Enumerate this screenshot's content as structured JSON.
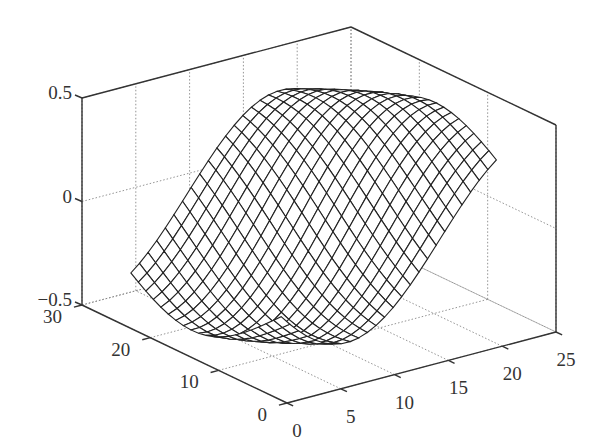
{
  "chart_data": {
    "type": "mesh3d",
    "title": "",
    "xlabel": "",
    "ylabel": "",
    "zlabel": "",
    "xlim": [
      0,
      25
    ],
    "ylim": [
      0,
      30
    ],
    "zlim": [
      -0.5,
      0.5
    ],
    "grid": true,
    "x_ticks": [
      "0",
      "5",
      "10",
      "15",
      "20",
      "25"
    ],
    "y_ticks": [
      "0",
      "10",
      "20",
      "30"
    ],
    "z_ticks": [
      "-0.5",
      "0",
      "0.5"
    ],
    "z_ticks_display": [
      "−0.5",
      "0",
      "0.5"
    ],
    "surface": {
      "description": "Wireframe mesh surface: wave ridge running diagonally, low trough near front-left, peak ~0.45 near back-right",
      "x_range": [
        2,
        22
      ],
      "y_range": [
        4,
        26
      ],
      "x_samples": 26,
      "y_samples": 21,
      "z_min": -0.45,
      "z_max": 0.45
    },
    "legend": null
  },
  "colors": {
    "axis": "#333333",
    "grid": "#888888",
    "mesh": "#222222",
    "background": "#ffffff"
  }
}
